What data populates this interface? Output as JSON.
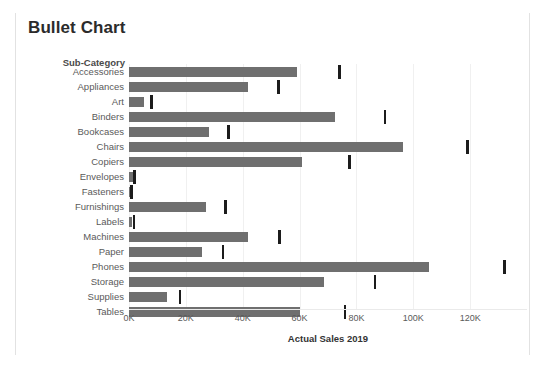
{
  "title": "Bullet Chart",
  "row_header": "Sub-Category",
  "axis_title": "Actual Sales 2019",
  "colors": {
    "bar": "#6f6f6f",
    "marker": "#1c1c1c",
    "grid": "#f0f0f0",
    "frame": "#e2e2e2",
    "title_text": "#2b2b2b",
    "label_text": "#5a5a5a"
  },
  "chart_data": {
    "type": "bar",
    "subtype": "bullet",
    "title": "Bullet Chart",
    "xlabel": "Actual Sales 2019",
    "ylabel": "Sub-Category",
    "orientation": "horizontal",
    "xlim": [
      0,
      140000
    ],
    "grid": true,
    "legend": "none",
    "tick_labels": [
      "0K",
      "20K",
      "40K",
      "60K",
      "80K",
      "100K",
      "120K"
    ],
    "tick_values": [
      0,
      20000,
      40000,
      60000,
      80000,
      100000,
      120000
    ],
    "categories": [
      "Accessories",
      "Appliances",
      "Art",
      "Binders",
      "Bookcases",
      "Chairs",
      "Copiers",
      "Envelopes",
      "Fasteners",
      "Furnishings",
      "Labels",
      "Machines",
      "Paper",
      "Phones",
      "Storage",
      "Supplies",
      "Tables"
    ],
    "series": [
      {
        "name": "Actual Sales 2019",
        "values": [
          59200,
          42000,
          5300,
          72500,
          28000,
          96500,
          61000,
          1600,
          600,
          27000,
          900,
          42000,
          25700,
          105600,
          68500,
          13500,
          60000
        ]
      },
      {
        "name": "Reference marker",
        "type": "marker",
        "values": [
          74000,
          52500,
          8000,
          90000,
          35000,
          119000,
          77500,
          2000,
          900,
          34000,
          1800,
          53000,
          33000,
          132000,
          86500,
          18000,
          76000
        ]
      }
    ]
  }
}
